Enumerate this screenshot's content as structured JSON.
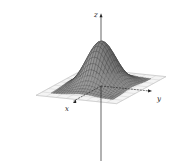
{
  "chart_data": {
    "type": "surface3d",
    "title": "",
    "function": "z = exp(-(x^2 + y^2))",
    "axes": {
      "x": {
        "label": "x"
      },
      "y": {
        "label": "y"
      },
      "z": {
        "label": "z"
      }
    },
    "grid_plane": true,
    "x_range": [
      -2,
      2
    ],
    "y_range": [
      -2,
      2
    ],
    "z_range": [
      0,
      1
    ],
    "peak": {
      "x": 0,
      "y": 0,
      "z": 1
    },
    "mesh_resolution": 24
  },
  "colors": {
    "surface_fill": "#9a9a9a",
    "mesh_line": "#3a3a3a",
    "axis": "#222222",
    "plane_border": "#e8e8e8",
    "plane_grid": "#c8c8c8"
  }
}
